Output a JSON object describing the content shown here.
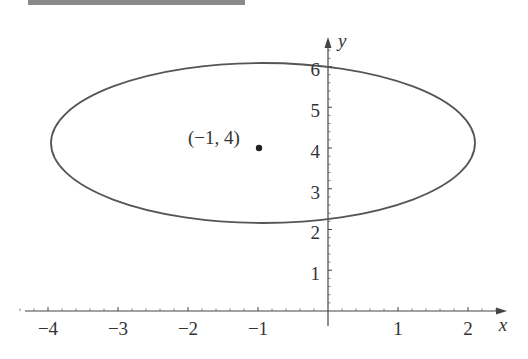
{
  "header": {
    "title": ""
  },
  "colors": {
    "curve": "#555555",
    "axis": "#444444",
    "text": "#333333",
    "header_bar": "#8a8a8a"
  },
  "chart_data": {
    "type": "line",
    "title": "",
    "equation": "(x+1)^2/9 + (y-4)^2/4 = 1",
    "center": {
      "x": -1,
      "y": 4
    },
    "semi_axes": {
      "a": 3,
      "b": 2
    },
    "xlabel": "x",
    "ylabel": "y",
    "xlim": [
      -4.4,
      2.6
    ],
    "ylim": [
      -0.3,
      6.8
    ],
    "x_ticks": [
      -4,
      -3,
      -2,
      -1,
      1,
      2
    ],
    "x_tick_labels": [
      "−4",
      "−3",
      "−2",
      "−1",
      "1",
      "2"
    ],
    "y_ticks": [
      1,
      2,
      3,
      4,
      5,
      6
    ],
    "y_tick_labels": [
      "1",
      "2",
      "3",
      "4",
      "5",
      "6"
    ],
    "minor_tick_step": 0.2,
    "grid": false,
    "annotations": [
      {
        "type": "point",
        "x": -1,
        "y": 4,
        "label": "(−1, 4)"
      }
    ]
  },
  "labels": {
    "x_axis": "x",
    "y_axis": "y",
    "center_point": "(−1, 4)",
    "xticks": {
      "m4": "−4",
      "m3": "−3",
      "m2": "−2",
      "m1": "−1",
      "p1": "1",
      "p2": "2"
    },
    "yticks": {
      "p1": "1",
      "p2": "2",
      "p3": "3",
      "p4": "4",
      "p5": "5",
      "p6": "6"
    }
  }
}
